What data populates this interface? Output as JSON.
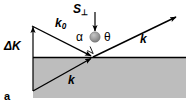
{
  "figure": {
    "panel_label": "a",
    "caption_letter": "a",
    "type": "scattering-geometry-diagram",
    "background_color": "#ffffff",
    "substrate_color": "#bdbdbd",
    "line_color": "#000000",
    "sphere_color": "#9a9a9a"
  },
  "labels": {
    "delta_k": "ΔK",
    "k_incident_symbol": "k",
    "k_incident_subscript": "0",
    "s_perp_symbol": "S",
    "s_perp_subscript": "⊥",
    "alpha": "α",
    "theta": "θ",
    "k_outgoing": "k",
    "k_in_surface": "k"
  },
  "geometry": {
    "surface_line_y": 57,
    "surface_line_x_start": 33,
    "surface_line_x_end": 186,
    "origin_x": 93,
    "origin_y": 57,
    "delta_k_arrow_x": 33,
    "delta_k_arrow_top_y": 25,
    "delta_k_arrow_bottom_y": 91,
    "k0_start": [
      32,
      26
    ],
    "k0_end": [
      90,
      55
    ],
    "k_out_end": [
      176,
      17
    ],
    "k_in_start": [
      33,
      91
    ],
    "s_perp_arrow_x": 95,
    "s_perp_arrow_top_y": 12,
    "s_perp_arrow_bottom_y": 31,
    "sphere_center": [
      95,
      37
    ],
    "sphere_radius": 5
  },
  "icon_names": {
    "delta_k_arrow": "up-arrow-icon",
    "k0_arrow": "incident-wavevector-arrow-icon",
    "k_out_arrow": "scattered-wavevector-arrow-icon",
    "k_in_arrow": "in-plane-wavevector-arrow-icon",
    "s_perp_arrow": "down-arrow-icon",
    "sphere": "atom-sphere-icon",
    "right_angle": "right-angle-marker-icon"
  }
}
